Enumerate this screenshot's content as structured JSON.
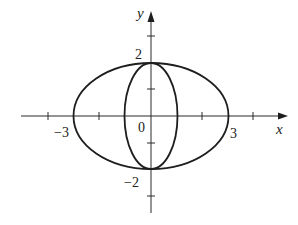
{
  "diagram": {
    "type": "coordinate-plot",
    "axes": {
      "x_label": "x",
      "y_label": "y"
    },
    "tick_labels": {
      "x_neg": "−3",
      "x_pos": "3",
      "origin": "0",
      "y_pos": "2",
      "y_neg": "−2"
    },
    "curves": [
      {
        "name": "outer-ellipse",
        "equation": "x^2/9 + y^2/4 = 1",
        "semi_x": 3,
        "semi_y": 2
      },
      {
        "name": "inner-ellipse",
        "equation": "x^2 + y^2/4 = 1",
        "semi_x": 1,
        "semi_y": 2
      }
    ],
    "x_ticks": [
      -4,
      -2,
      2,
      4
    ],
    "y_ticks": [
      -3,
      -1,
      1,
      3
    ],
    "colors": {
      "stroke": "#1e1e1e",
      "background": "#ffffff"
    }
  }
}
